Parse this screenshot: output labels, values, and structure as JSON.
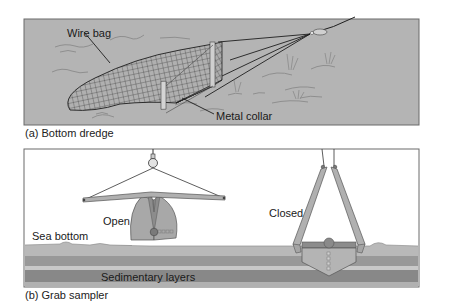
{
  "panels": [
    {
      "id": "a",
      "caption": "(a) Bottom dredge",
      "labels": {
        "wire_bag": "Wire bag",
        "metal_collar": "Metal collar"
      }
    },
    {
      "id": "b",
      "caption": "(b) Grab sampler",
      "labels": {
        "open": "Open",
        "closed": "Closed",
        "sea_bottom": "Sea bottom",
        "sedimentary_layers": "Sedimentary layers"
      }
    }
  ],
  "colors": {
    "panel_a_bg": "#b4b4b4",
    "panel_b_bg": "#ffffff",
    "device_fill": "#a8a8a8",
    "device_dark": "#8c8c8c",
    "sediment_top": "#b9b9b9",
    "sediment_dark1": "#999999",
    "sediment_light": "#c9c9c9",
    "sediment_dark2": "#888888",
    "sediment_bottom": "#b1b1b1",
    "line": "#1e1e1e"
  }
}
